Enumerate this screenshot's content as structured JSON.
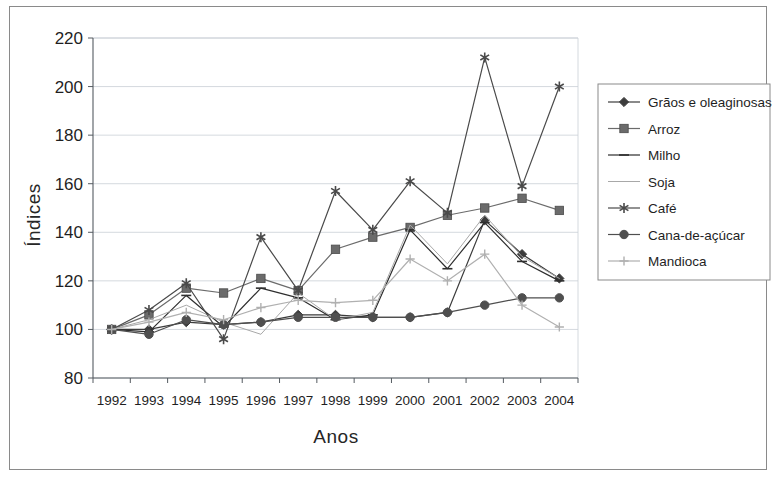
{
  "figure": {
    "background": "#ffffff",
    "frame_color": "#8a8a8a"
  },
  "chart_data": {
    "type": "line",
    "title": "",
    "xlabel": "Anos",
    "ylabel": "Índices",
    "x": [
      1992,
      1993,
      1994,
      1995,
      1996,
      1997,
      1998,
      1999,
      2000,
      2001,
      2002,
      2003,
      2004
    ],
    "categories": [
      "1992",
      "1993",
      "1994",
      "1995",
      "1996",
      "1997",
      "1998",
      "1999",
      "2000",
      "2001",
      "2002",
      "2003",
      "2004"
    ],
    "ylim": [
      80,
      220
    ],
    "yticks": [
      80,
      100,
      120,
      140,
      160,
      180,
      200,
      220
    ],
    "ytick_labels": [
      "80",
      "100",
      "120",
      "140",
      "160",
      "180",
      "200",
      "220"
    ],
    "grid": true,
    "legend_position": "right",
    "series": [
      {
        "name": "Grãos e oleaginosas",
        "marker": "diamond",
        "color": "#3c3c3c",
        "values": [
          100,
          100,
          103,
          102,
          103,
          106,
          106,
          105,
          105,
          107,
          145,
          131,
          121
        ]
      },
      {
        "name": "Arroz",
        "marker": "square",
        "color": "#6b6b6b",
        "values": [
          100,
          106,
          117,
          115,
          121,
          116,
          133,
          138,
          142,
          147,
          150,
          154,
          149
        ]
      },
      {
        "name": "Milho",
        "marker": "dash",
        "color": "#2e2e2e",
        "values": [
          100,
          99,
          114,
          101,
          117,
          113,
          104,
          106,
          141,
          125,
          144,
          128,
          120
        ]
      },
      {
        "name": "Soja",
        "marker": "none",
        "color": "#a8a8a8",
        "values": [
          100,
          104,
          110,
          103,
          98,
          115,
          104,
          107,
          143,
          127,
          147,
          130,
          121
        ]
      },
      {
        "name": "Café",
        "marker": "star",
        "color": "#4a4a4a",
        "values": [
          100,
          108,
          119,
          96,
          138,
          116,
          157,
          141,
          161,
          148,
          212,
          159,
          200
        ]
      },
      {
        "name": "Cana-de-açúcar",
        "marker": "circle",
        "color": "#4f4f4f",
        "values": [
          100,
          98,
          104,
          102,
          103,
          105,
          105,
          105,
          105,
          107,
          110,
          113,
          113
        ]
      },
      {
        "name": "Mandioca",
        "marker": "plus",
        "color": "#b0b0b0",
        "values": [
          100,
          103,
          107,
          104,
          109,
          112,
          111,
          112,
          129,
          120,
          131,
          110,
          101
        ]
      }
    ]
  }
}
